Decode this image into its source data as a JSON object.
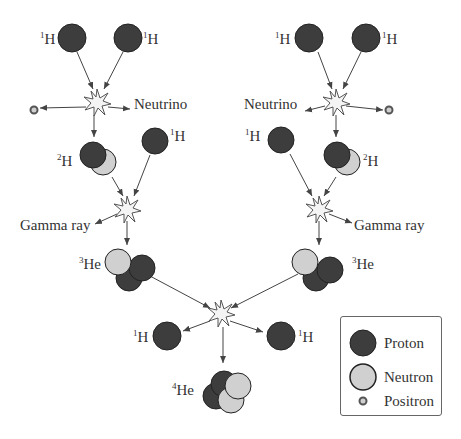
{
  "colors": {
    "proton": "#3d3d3d",
    "neutron": "#d0d0d0",
    "positron_ring": "#555555",
    "positron_center": "#cfcfcf",
    "outline": "#222222",
    "arrow": "#444444",
    "star_fill": "#f4f4f4"
  },
  "left_branch": {
    "h1_a": {
      "mass": "1",
      "symbol": "H"
    },
    "h1_b": {
      "mass": "1",
      "symbol": "H"
    },
    "neutrino": "Neutrino",
    "h2": {
      "mass": "2",
      "symbol": "H"
    },
    "h1_c": {
      "mass": "1",
      "symbol": "H"
    },
    "gamma": "Gamma ray",
    "he3": {
      "mass": "3",
      "symbol": "He"
    }
  },
  "right_branch": {
    "h1_a": {
      "mass": "1",
      "symbol": "H"
    },
    "h1_b": {
      "mass": "1",
      "symbol": "H"
    },
    "neutrino": "Neutrino",
    "h1_c": {
      "mass": "1",
      "symbol": "H"
    },
    "h2": {
      "mass": "2",
      "symbol": "H"
    },
    "gamma": "Gamma ray",
    "he3": {
      "mass": "3",
      "symbol": "He"
    }
  },
  "final": {
    "h1_left": {
      "mass": "1",
      "symbol": "H"
    },
    "h1_right": {
      "mass": "1",
      "symbol": "H"
    },
    "he4": {
      "mass": "4",
      "symbol": "He"
    }
  },
  "legend": {
    "items": [
      {
        "label": "Proton",
        "type": "proton"
      },
      {
        "label": "Neutron",
        "type": "neutron"
      },
      {
        "label": "Positron",
        "type": "positron"
      }
    ]
  }
}
